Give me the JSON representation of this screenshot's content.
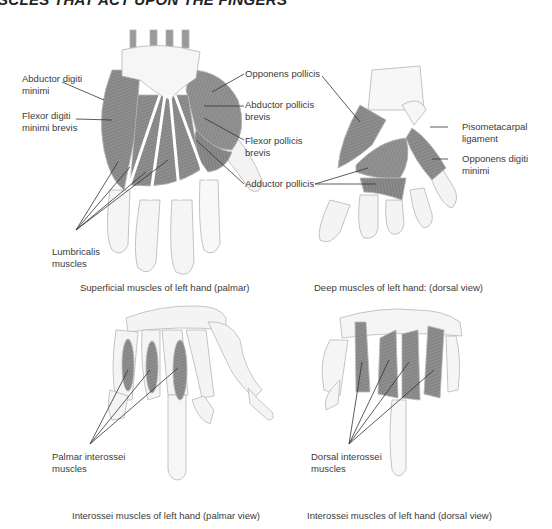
{
  "figure": {
    "title": "SCLES THAT ACT UPON THE FINGERS",
    "colors": {
      "muscle": "#8c8c8c",
      "bone": "#f4f4f4",
      "outline": "#b8b8b8",
      "leader": "#333333",
      "text": "#3a3a3a"
    }
  },
  "panels": [
    {
      "id": "superficial-palmar",
      "caption": "Superficial muscles of left hand (palmar)",
      "labels": [
        {
          "text": "Abductor digiti\nminimi"
        },
        {
          "text": "Flexor digiti\nminimi brevis"
        },
        {
          "text": "Lumbricalis\nmuscles"
        },
        {
          "text": "Opponens pollicis"
        },
        {
          "text": "Abductor pollicis\nbrevis"
        },
        {
          "text": "Flexor pollicis\nbrevis"
        },
        {
          "text": "Adductor pollicis"
        }
      ]
    },
    {
      "id": "deep-dorsal",
      "caption": "Deep muscles of left hand: (dorsal view)",
      "labels": [
        {
          "text": "Pisometacarpal\nligament"
        },
        {
          "text": "Opponens digiti\nminimi"
        }
      ]
    },
    {
      "id": "interossei-palmar",
      "caption": "Interossei muscles of left hand (palmar view)",
      "labels": [
        {
          "text": "Palmar interossei\nmuscles"
        }
      ]
    },
    {
      "id": "interossei-dorsal",
      "caption": "Interossei muscles of left hand (dorsal view)",
      "labels": [
        {
          "text": "Dorsal interossei\nmuscles"
        }
      ]
    }
  ]
}
